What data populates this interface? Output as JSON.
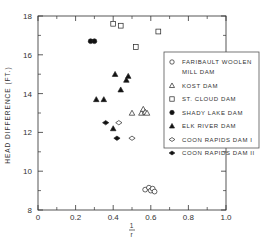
{
  "chart_data": {
    "type": "scatter",
    "title": "",
    "xlabel_top": "1",
    "xlabel_bottom": "r",
    "ylabel": "HEAD DIFFERENCE (FT.)",
    "xlim": [
      0,
      1.0
    ],
    "ylim": [
      8,
      18
    ],
    "x_ticks": [
      0,
      0.2,
      0.4,
      0.6,
      0.8,
      1.0
    ],
    "x_tick_labels": [
      "0",
      "0.2",
      "0.4",
      "0.6",
      "0.8",
      "1.0"
    ],
    "x_minor_ticks": [
      0.1,
      0.3,
      0.5,
      0.7,
      0.9
    ],
    "y_ticks": [
      8,
      10,
      12,
      14,
      16,
      18
    ],
    "y_tick_labels": [
      "8",
      "10",
      "12",
      "14",
      "16",
      "18"
    ],
    "y_minor_ticks": [
      9,
      11,
      13,
      15,
      17
    ],
    "grid": false,
    "legend_position": "right",
    "series": [
      {
        "name": "FARIBAULT WOOLEN MILL DAM",
        "legend_lines": [
          "FARIBAULT WOOLEN",
          "MILL DAM"
        ],
        "marker": "open-circle",
        "points": [
          [
            0.57,
            9.05
          ],
          [
            0.59,
            9.15
          ],
          [
            0.6,
            9.0
          ],
          [
            0.61,
            9.1
          ],
          [
            0.62,
            8.95
          ]
        ]
      },
      {
        "name": "KOST DAM",
        "legend_lines": [
          "KOST DAM"
        ],
        "marker": "open-triangle",
        "points": [
          [
            0.5,
            13.0
          ],
          [
            0.55,
            13.0
          ],
          [
            0.56,
            13.2
          ],
          [
            0.57,
            13.05
          ],
          [
            0.58,
            13.0
          ]
        ]
      },
      {
        "name": "ST. CLOUD DAM",
        "legend_lines": [
          "ST. CLOUD DAM"
        ],
        "marker": "open-square",
        "points": [
          [
            0.4,
            17.6
          ],
          [
            0.44,
            17.5
          ],
          [
            0.52,
            16.4
          ],
          [
            0.64,
            17.2
          ]
        ]
      },
      {
        "name": "SHADY LAKE DAM",
        "legend_lines": [
          "SHADY LAKE DAM"
        ],
        "marker": "filled-circle",
        "points": [
          [
            0.28,
            16.7
          ],
          [
            0.3,
            16.7
          ]
        ]
      },
      {
        "name": "ELK RIVER DAM",
        "legend_lines": [
          "ELK RIVER DAM"
        ],
        "marker": "filled-triangle",
        "points": [
          [
            0.31,
            13.7
          ],
          [
            0.35,
            13.7
          ],
          [
            0.41,
            15.0
          ],
          [
            0.44,
            14.2
          ],
          [
            0.47,
            14.7
          ],
          [
            0.48,
            14.9
          ],
          [
            0.4,
            12.2
          ]
        ]
      },
      {
        "name": "COON RAPIDS DAM I",
        "legend_lines": [
          "COON RAPIDS DAM I"
        ],
        "marker": "open-diamond",
        "points": [
          [
            0.43,
            12.5
          ],
          [
            0.5,
            11.7
          ]
        ]
      },
      {
        "name": "COON RAPIDS DAM II",
        "legend_lines": [
          "COON RAPIDS DAM II"
        ],
        "marker": "filled-diamond",
        "points": [
          [
            0.36,
            12.5
          ],
          [
            0.42,
            11.7
          ]
        ]
      }
    ]
  }
}
